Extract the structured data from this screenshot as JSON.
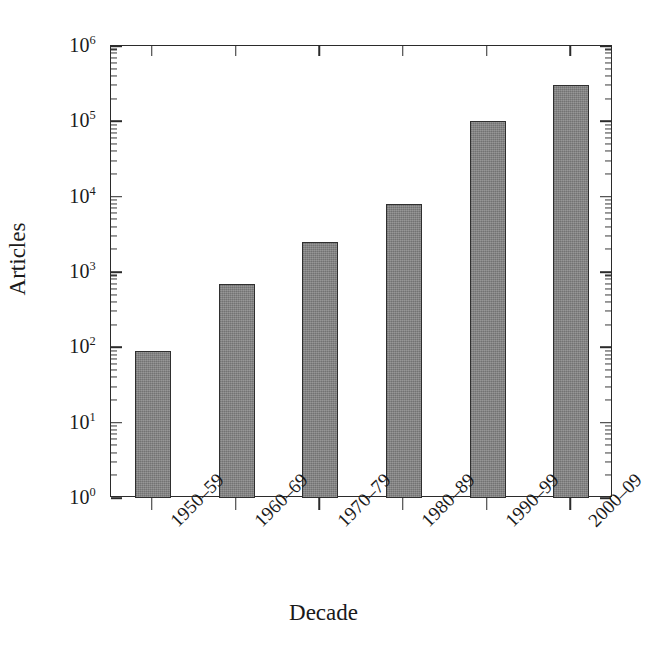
{
  "chart_data": {
    "type": "bar",
    "title": "",
    "subtitle": "",
    "xlabel": "Decade",
    "ylabel": "Articles",
    "categories": [
      "1950–59",
      "1960–69",
      "1970–79",
      "1980–89",
      "1990–99",
      "2000–09"
    ],
    "values": [
      90,
      700,
      2500,
      8000,
      100000,
      300000
    ],
    "yscale": "log",
    "ylim": [
      1,
      1000000
    ],
    "ytick_labels": [
      "10⁰",
      "10¹",
      "10²",
      "10³",
      "10⁴",
      "10⁵",
      "10⁶"
    ],
    "ytick_values": [
      1,
      10,
      100,
      1000,
      10000,
      100000,
      1000000
    ],
    "grid": false,
    "legend": null,
    "bar_color": "#808080",
    "bar_edge_color": "#2f2f2f",
    "axis_color": "#2b2b2b",
    "minor_ticks": true,
    "annotations": []
  },
  "axis": {
    "y_exponents": [
      0,
      1,
      2,
      3,
      4,
      5,
      6
    ],
    "mantissa": "10"
  }
}
